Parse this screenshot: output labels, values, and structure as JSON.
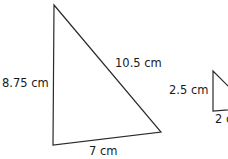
{
  "figure": {
    "large_triangle": {
      "side_left": "8.75 cm",
      "side_hyp": "10.5 cm",
      "side_bottom": "7 cm"
    },
    "small_triangle": {
      "side_left": "2.5 cm",
      "side_bottom": "2 cm"
    },
    "stroke_color": "#2a2a2a"
  }
}
